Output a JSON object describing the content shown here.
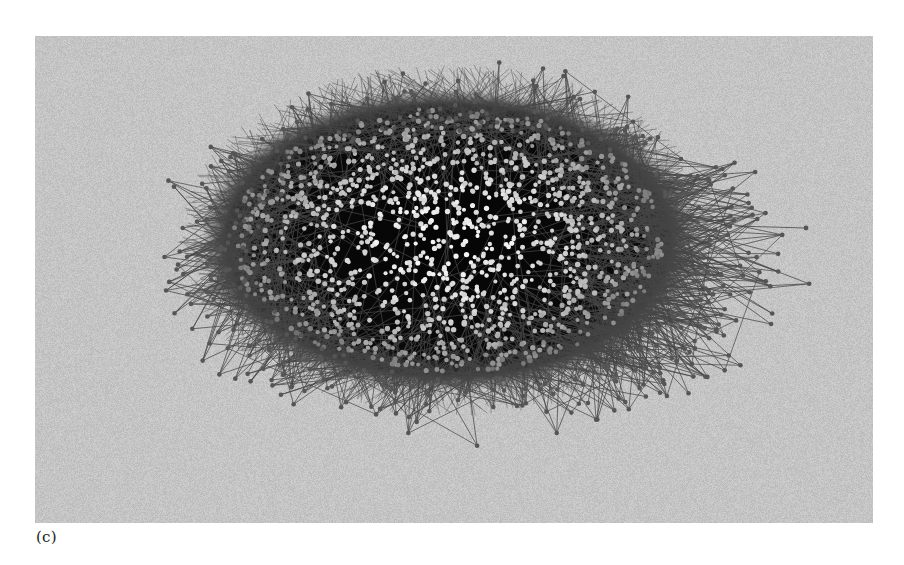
{
  "figure": {
    "caption": "(c)",
    "panel_background": "#c4c4c4",
    "page_background": "#ffffff"
  },
  "network": {
    "type": "force-directed network graph",
    "layout_shape": "ellipse",
    "core": {
      "center_x": 448,
      "center_y": 240,
      "radius_x": 220,
      "radius_y": 135,
      "background_color": "#080808"
    },
    "outer_extent": {
      "left": 135,
      "right": 808,
      "top": 60,
      "bottom": 450
    },
    "node_count_core": 1400,
    "node_count_periphery": 420,
    "edge_count": 2600,
    "node_radius": 2.3,
    "colors": {
      "core_node_light": "#e6e6e6",
      "core_node_mid": "#9a9a9a",
      "periphery_node": "#555555",
      "edge": "#4a4a4a"
    },
    "seed": 20240611
  }
}
